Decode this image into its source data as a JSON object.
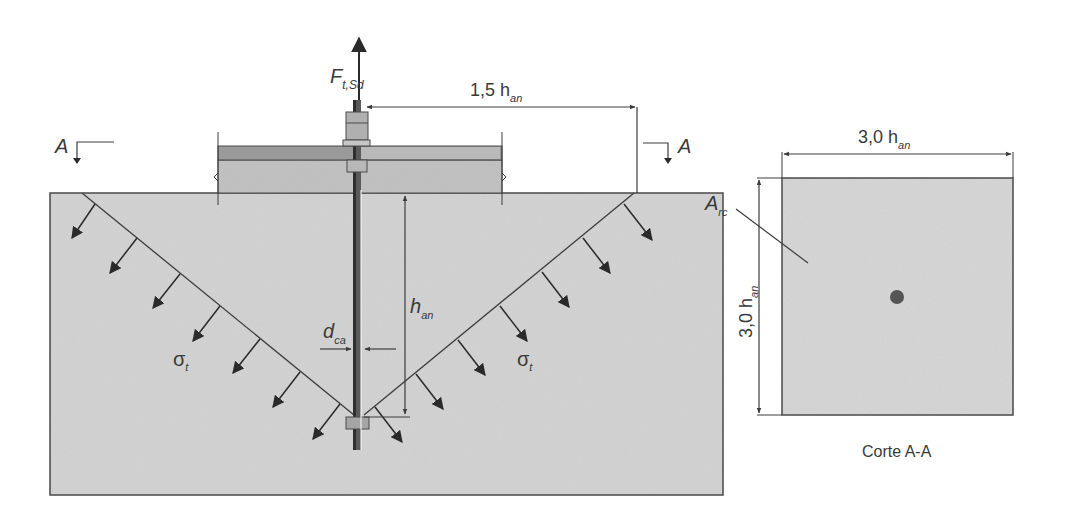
{
  "figure": {
    "main_view": {
      "force_label": "F",
      "force_sub": "t,Sd",
      "dim_top_label": "1,5 h",
      "dim_top_sub": "an",
      "embed_label": "h",
      "embed_sub": "an",
      "diameter_label": "d",
      "diameter_sub": "ca",
      "stress_left": "σ",
      "stress_left_sub": "t",
      "stress_right": "σ",
      "stress_right_sub": "t",
      "section_mark_left": "A",
      "section_mark_right": "A"
    },
    "section_view": {
      "width_label": "3,0 h",
      "width_sub": "an",
      "height_label": "3,0 h",
      "height_sub": "an",
      "area_label": "A",
      "area_sub": "rc",
      "caption": "Corte A-A"
    },
    "colors": {
      "concrete": "#d2d2d2",
      "line": "#3c3c3c",
      "arrow": "#2a2a2a",
      "plate": "#8a8a8a",
      "slab": "#bdbdbd"
    }
  }
}
